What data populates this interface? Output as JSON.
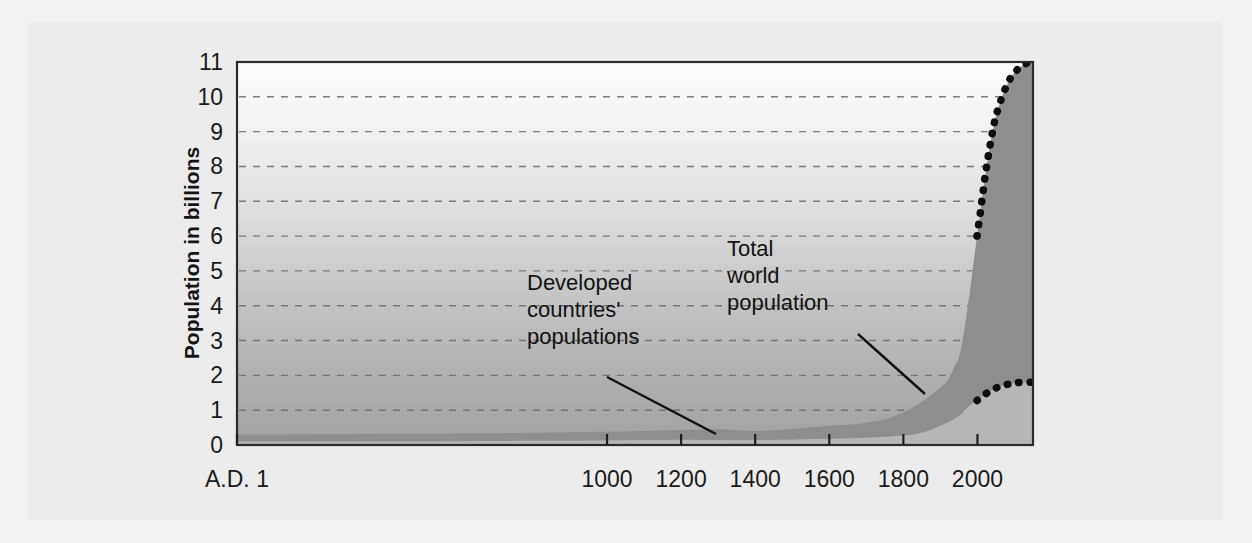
{
  "figure": {
    "background_color": "#f2f2f2",
    "panel_color": "#ececec"
  },
  "chart_data": {
    "type": "area",
    "title": "",
    "subtitle": "",
    "xlabel": "",
    "ylabel": "Population in billions",
    "xlim": [
      1,
      2150
    ],
    "ylim": [
      0,
      11
    ],
    "grid": true,
    "legend_position": "none",
    "colors": {
      "total_world_band": "#8e8e8e",
      "developed_band": "#b3b3b3",
      "plot_bg_top": "#fbfbfb",
      "plot_bg_bottom": "#9e9e9e",
      "projection_line": "#0d0d0d",
      "gridline": "#6a6a6a",
      "frame": "#2b2b2b"
    },
    "xticks": [
      {
        "label": "A.D. 1",
        "value": 1
      },
      {
        "label": "1000",
        "value": 1000
      },
      {
        "label": "1200",
        "value": 1200
      },
      {
        "label": "1400",
        "value": 1400
      },
      {
        "label": "1600",
        "value": 1600
      },
      {
        "label": "1800",
        "value": 1800
      },
      {
        "label": "2000",
        "value": 2000
      }
    ],
    "yticks": [
      0,
      1,
      2,
      3,
      4,
      5,
      6,
      7,
      8,
      9,
      10,
      11
    ],
    "series": [
      {
        "name": "Total world population",
        "kind": "historical",
        "x": [
          1,
          200,
          400,
          600,
          800,
          1000,
          1100,
          1200,
          1300,
          1400,
          1500,
          1600,
          1650,
          1700,
          1750,
          1800,
          1850,
          1900,
          1920,
          1940,
          1950,
          1960,
          1970,
          1980,
          1990,
          1999
        ],
        "values": [
          0.3,
          0.31,
          0.32,
          0.33,
          0.35,
          0.38,
          0.4,
          0.43,
          0.45,
          0.4,
          0.46,
          0.55,
          0.58,
          0.64,
          0.74,
          0.94,
          1.24,
          1.65,
          1.86,
          2.3,
          2.52,
          3.02,
          3.7,
          4.44,
          5.28,
          6.0
        ]
      },
      {
        "name": "Total world population",
        "kind": "projection",
        "x": [
          1999,
          2010,
          2020,
          2030,
          2040,
          2050,
          2070,
          2090,
          2110,
          2130,
          2150
        ],
        "values": [
          6.0,
          6.85,
          7.65,
          8.35,
          8.95,
          9.45,
          10.1,
          10.55,
          10.8,
          10.95,
          11.0
        ]
      },
      {
        "name": "Developed countries' populations",
        "kind": "historical",
        "x": [
          1,
          200,
          400,
          600,
          800,
          1000,
          1200,
          1400,
          1600,
          1700,
          1800,
          1850,
          1900,
          1950,
          1970,
          1990,
          1999
        ],
        "values": [
          0.1,
          0.1,
          0.1,
          0.11,
          0.12,
          0.13,
          0.15,
          0.14,
          0.18,
          0.21,
          0.27,
          0.35,
          0.55,
          0.83,
          1.05,
          1.21,
          1.28
        ]
      },
      {
        "name": "Developed countries' populations",
        "kind": "projection",
        "x": [
          1999,
          2020,
          2040,
          2060,
          2080,
          2100,
          2120,
          2150
        ],
        "values": [
          1.28,
          1.45,
          1.58,
          1.68,
          1.74,
          1.78,
          1.8,
          1.8
        ]
      }
    ],
    "annotations": [
      {
        "id": "developed-countries-annotation",
        "lines": [
          "Developed",
          "countries'",
          "populations"
        ],
        "text": "Developed countries' populations",
        "text_x": 527,
        "text_y": 290,
        "leader": {
          "x1": 607,
          "y1": 377,
          "x2": 716,
          "y2": 434
        }
      },
      {
        "id": "total-world-population-annotation",
        "lines": [
          "Total",
          "world",
          "population"
        ],
        "text": "Total world population",
        "text_x": 727,
        "text_y": 256,
        "leader": {
          "x1": 858,
          "y1": 334,
          "x2": 925,
          "y2": 394
        }
      }
    ]
  }
}
